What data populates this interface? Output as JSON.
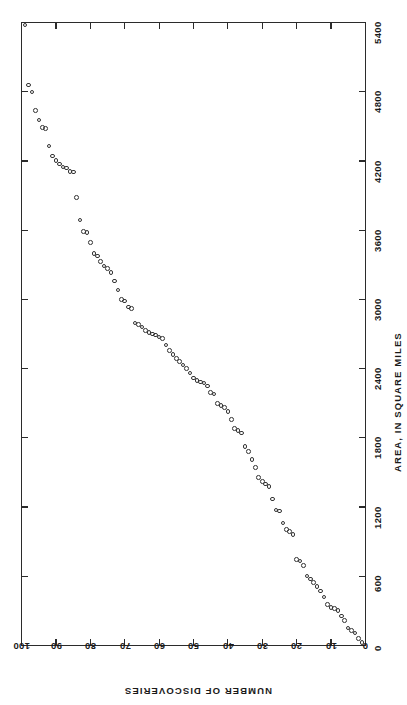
{
  "chart_data": {
    "type": "scatter",
    "title": "",
    "subtitle": "",
    "orientation": "rotated-90",
    "xlabel": "NUMBER OF DISCOVERIES",
    "ylabel": "AREA, IN SQUARE MILES",
    "xlim": [
      0,
      100
    ],
    "ylim": [
      0,
      5400
    ],
    "x_ticks": [
      0,
      10,
      20,
      30,
      40,
      50,
      60,
      70,
      80,
      90,
      100
    ],
    "y_ticks": [
      0,
      600,
      1200,
      1800,
      2400,
      3000,
      3600,
      4200,
      4800,
      5400
    ],
    "x_tick_labels": [
      "0",
      "10",
      "20",
      "30",
      "40",
      "50",
      "60",
      "70",
      "80",
      "90",
      "100"
    ],
    "y_tick_labels": [
      "0",
      "600",
      "1200",
      "1800",
      "2400",
      "3000",
      "3600",
      "4200",
      "4800",
      "5400"
    ],
    "grid": false,
    "legend": null,
    "marker": "open-circle",
    "marker_color": "#333333",
    "axis_color": "#2b2b2b",
    "background_color": "#ffffff",
    "note": "x = NUMBER OF DISCOVERIES plotted right-to-left along bottom; y = AREA plotted bottom-to-top along right edge",
    "points": [
      [
        1,
        25
      ],
      [
        2,
        60
      ],
      [
        3,
        105
      ],
      [
        4,
        130
      ],
      [
        5,
        150
      ],
      [
        6,
        215
      ],
      [
        7,
        255
      ],
      [
        8,
        300
      ],
      [
        9,
        318
      ],
      [
        10,
        330
      ],
      [
        11,
        355
      ],
      [
        12,
        420
      ],
      [
        13,
        470
      ],
      [
        14,
        510
      ],
      [
        15,
        545
      ],
      [
        16,
        575
      ],
      [
        17,
        600
      ],
      [
        18,
        690
      ],
      [
        19,
        730
      ],
      [
        20,
        745
      ],
      [
        21,
        960
      ],
      [
        22,
        985
      ],
      [
        23,
        1005
      ],
      [
        24,
        1060
      ],
      [
        25,
        1165
      ],
      [
        26,
        1175
      ],
      [
        27,
        1270
      ],
      [
        28,
        1375
      ],
      [
        29,
        1400
      ],
      [
        30,
        1420
      ],
      [
        31,
        1455
      ],
      [
        32,
        1540
      ],
      [
        33,
        1610
      ],
      [
        34,
        1680
      ],
      [
        35,
        1725
      ],
      [
        36,
        1840
      ],
      [
        37,
        1865
      ],
      [
        38,
        1880
      ],
      [
        39,
        1960
      ],
      [
        40,
        2030
      ],
      [
        41,
        2060
      ],
      [
        42,
        2080
      ],
      [
        43,
        2095
      ],
      [
        44,
        2180
      ],
      [
        45,
        2195
      ],
      [
        46,
        2250
      ],
      [
        47,
        2275
      ],
      [
        48,
        2285
      ],
      [
        49,
        2295
      ],
      [
        50,
        2320
      ],
      [
        51,
        2360
      ],
      [
        52,
        2400
      ],
      [
        53,
        2430
      ],
      [
        54,
        2460
      ],
      [
        55,
        2490
      ],
      [
        56,
        2520
      ],
      [
        57,
        2555
      ],
      [
        58,
        2605
      ],
      [
        59,
        2660
      ],
      [
        60,
        2675
      ],
      [
        61,
        2690
      ],
      [
        62,
        2700
      ],
      [
        63,
        2715
      ],
      [
        64,
        2730
      ],
      [
        65,
        2760
      ],
      [
        66,
        2780
      ],
      [
        67,
        2795
      ],
      [
        68,
        2920
      ],
      [
        69,
        2935
      ],
      [
        70,
        2985
      ],
      [
        71,
        3000
      ],
      [
        72,
        3080
      ],
      [
        73,
        3160
      ],
      [
        74,
        3235
      ],
      [
        75,
        3270
      ],
      [
        76,
        3290
      ],
      [
        77,
        3330
      ],
      [
        78,
        3375
      ],
      [
        79,
        3400
      ],
      [
        80,
        3495
      ],
      [
        81,
        3580
      ],
      [
        82,
        3590
      ],
      [
        83,
        3690
      ],
      [
        84,
        3885
      ],
      [
        85,
        4105
      ],
      [
        86,
        4110
      ],
      [
        87,
        4140
      ],
      [
        88,
        4150
      ],
      [
        89,
        4175
      ],
      [
        90,
        4205
      ],
      [
        91,
        4245
      ],
      [
        92,
        4330
      ],
      [
        93,
        4480
      ],
      [
        94,
        4490
      ],
      [
        95,
        4555
      ],
      [
        96,
        4640
      ],
      [
        97,
        4800
      ],
      [
        98,
        4860
      ],
      [
        99,
        5380
      ]
    ]
  },
  "axis_titles": {
    "area": "AREA, IN SQUARE MILES",
    "discoveries": "NUMBER OF DISCOVERIES"
  }
}
